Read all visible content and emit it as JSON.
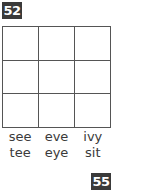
{
  "page_numbers": {
    "top": "52",
    "bottom": "55"
  },
  "grid": {
    "rows": 3,
    "cols": 3
  },
  "words": [
    [
      "see",
      "eve",
      "ivy"
    ],
    [
      "tee",
      "eye",
      "sit"
    ]
  ],
  "colors": {
    "badge_bg": "#3a3a3a",
    "badge_text": "#ffffff",
    "grid_line": "#555555"
  }
}
